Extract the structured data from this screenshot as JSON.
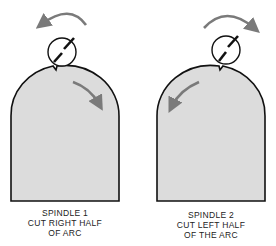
{
  "colors": {
    "workpiece_fill": "#dcdcdc",
    "outline": "#111111",
    "arrow": "#7a7a7a",
    "background": "#ffffff"
  },
  "panels": [
    {
      "id": "spindle-1",
      "caption": [
        "SPINDLE 1",
        "CUT RIGHT HALF",
        "OF ARC"
      ],
      "cutter_rotation": "counterclockwise",
      "feed_direction": "clockwise-right"
    },
    {
      "id": "spindle-2",
      "caption": [
        "SPINDLE 2",
        "CUT LEFT HALF",
        "OF THE ARC"
      ],
      "cutter_rotation": "clockwise",
      "feed_direction": "counterclockwise-left"
    }
  ]
}
